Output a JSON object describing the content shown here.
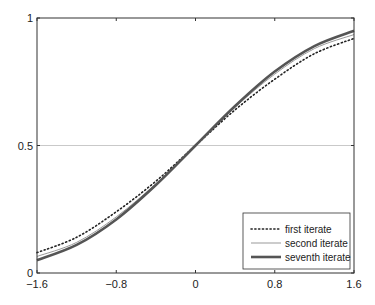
{
  "chart_data": {
    "type": "line",
    "title": "",
    "xlabel": "",
    "ylabel": "",
    "xlim": [
      -1.6,
      1.6
    ],
    "ylim": [
      0,
      1
    ],
    "x_ticks": [
      -1.6,
      -0.8,
      0,
      0.8,
      1.6
    ],
    "x_tick_labels": [
      "−1.6",
      "−0.8",
      "0",
      "0.8",
      "1.6"
    ],
    "y_ticks": [
      0,
      0.5,
      1
    ],
    "y_tick_labels": [
      "0",
      "0.5",
      "1"
    ],
    "grid": "horizontal line at y=0.5 only",
    "legend_position": "lower right",
    "x": [
      -1.6,
      -1.2,
      -0.8,
      -0.4,
      0,
      0.4,
      0.8,
      1.2,
      1.6
    ],
    "series": [
      {
        "name": "first iterate",
        "style": "dotted",
        "values": [
          0.08,
          0.14,
          0.24,
          0.36,
          0.5,
          0.64,
          0.76,
          0.86,
          0.92
        ]
      },
      {
        "name": "second iterate",
        "style": "thin",
        "values": [
          0.065,
          0.12,
          0.22,
          0.35,
          0.5,
          0.65,
          0.78,
          0.88,
          0.935
        ]
      },
      {
        "name": "seventh iterate",
        "style": "thick",
        "values": [
          0.05,
          0.11,
          0.21,
          0.345,
          0.5,
          0.655,
          0.79,
          0.89,
          0.95
        ]
      }
    ]
  },
  "colors": {
    "axis": "#333333",
    "grid": "#bbbbbb",
    "first": "#222222",
    "second": "#999999",
    "seventh": "#555555"
  }
}
